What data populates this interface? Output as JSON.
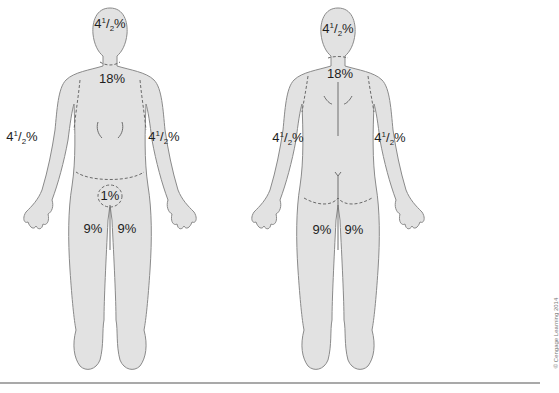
{
  "figure": {
    "views": [
      {
        "name": "anterior",
        "labels": {
          "head": {
            "whole": "4",
            "num": "1",
            "den": "2",
            "unit": "%"
          },
          "trunk": "18%",
          "left_arm": {
            "whole": "4",
            "num": "1",
            "den": "2",
            "unit": "%"
          },
          "right_arm": {
            "whole": "4",
            "num": "1",
            "den": "2",
            "unit": "%"
          },
          "genitals": "1%",
          "left_leg": "9%",
          "right_leg": "9%"
        }
      },
      {
        "name": "posterior",
        "labels": {
          "head": {
            "whole": "4",
            "num": "1",
            "den": "2",
            "unit": "%"
          },
          "trunk": "18%",
          "left_arm": {
            "whole": "4",
            "num": "1",
            "den": "2",
            "unit": "%"
          },
          "right_arm": {
            "whole": "4",
            "num": "1",
            "den": "2",
            "unit": "%"
          },
          "left_leg": "9%",
          "right_leg": "9%"
        }
      }
    ],
    "credit": "© Cengage Learning 2014"
  }
}
